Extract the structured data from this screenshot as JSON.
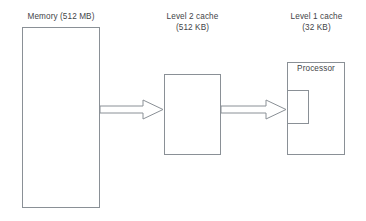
{
  "diagram": {
    "background_color": "#ffffff",
    "line_color": "#8a9096",
    "text_color": "#3f4448",
    "nodes": [
      {
        "id": "memory",
        "label_line1": "Memory (512 MB)",
        "label_line2": "",
        "shape": "rectangle"
      },
      {
        "id": "l2-cache",
        "label_line1": "Level 2 cache",
        "label_line2": "(512 KB)",
        "shape": "rectangle"
      },
      {
        "id": "l1-cache",
        "label_line1": "Level 1 cache",
        "label_line2": "(32 KB)",
        "shape": "rectangle"
      }
    ],
    "processor": {
      "label": "Processor"
    },
    "arrows": [
      {
        "id": "memory-to-l2",
        "from": "memory",
        "to": "l2-cache",
        "direction": "right",
        "style": "hollow-block-arrow"
      },
      {
        "id": "l2-to-l1",
        "from": "l2-cache",
        "to": "l1-cache",
        "direction": "right",
        "style": "hollow-block-arrow"
      }
    ]
  }
}
